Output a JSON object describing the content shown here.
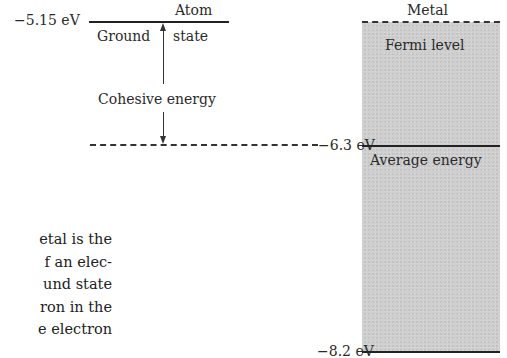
{
  "diagram": {
    "atom": {
      "title": "Atom",
      "ground_state_energy": "−5.15 eV",
      "ground_state_label_left": "Ground",
      "ground_state_label_right": "state",
      "cohesive_label": "Cohesive energy"
    },
    "metal": {
      "title": "Metal",
      "fermi_label": "Fermi level",
      "average_label": "Average energy",
      "average_energy": "−6.3 eV",
      "bottom_energy": "−8.2 eV",
      "band_color": "#cfcfcf"
    }
  },
  "body_text": {
    "lines": [
      "etal is the",
      "f an elec-",
      "und state",
      "ron in the",
      "e electron"
    ]
  }
}
